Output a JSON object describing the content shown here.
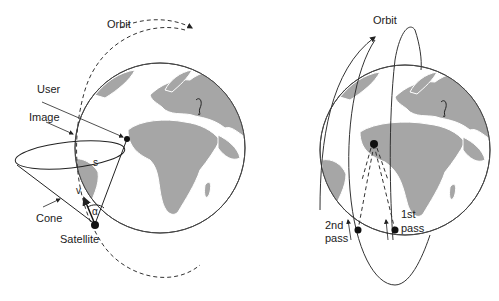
{
  "left_panel": {
    "labels": {
      "orbit": "Orbit",
      "user": "User",
      "image": "Image",
      "s": "s",
      "v": "v",
      "alpha": "α",
      "cone": "Cone",
      "satellite": "Satellite"
    }
  },
  "right_panel": {
    "labels": {
      "orbit": "Orbit",
      "pass2_line1": "2nd",
      "pass2_line2": "pass",
      "pass1_line1": "1st",
      "pass1_line2": "pass"
    }
  },
  "colors": {
    "land": "#a6a6a6",
    "ocean": "#ffffff",
    "stroke": "#333333"
  }
}
